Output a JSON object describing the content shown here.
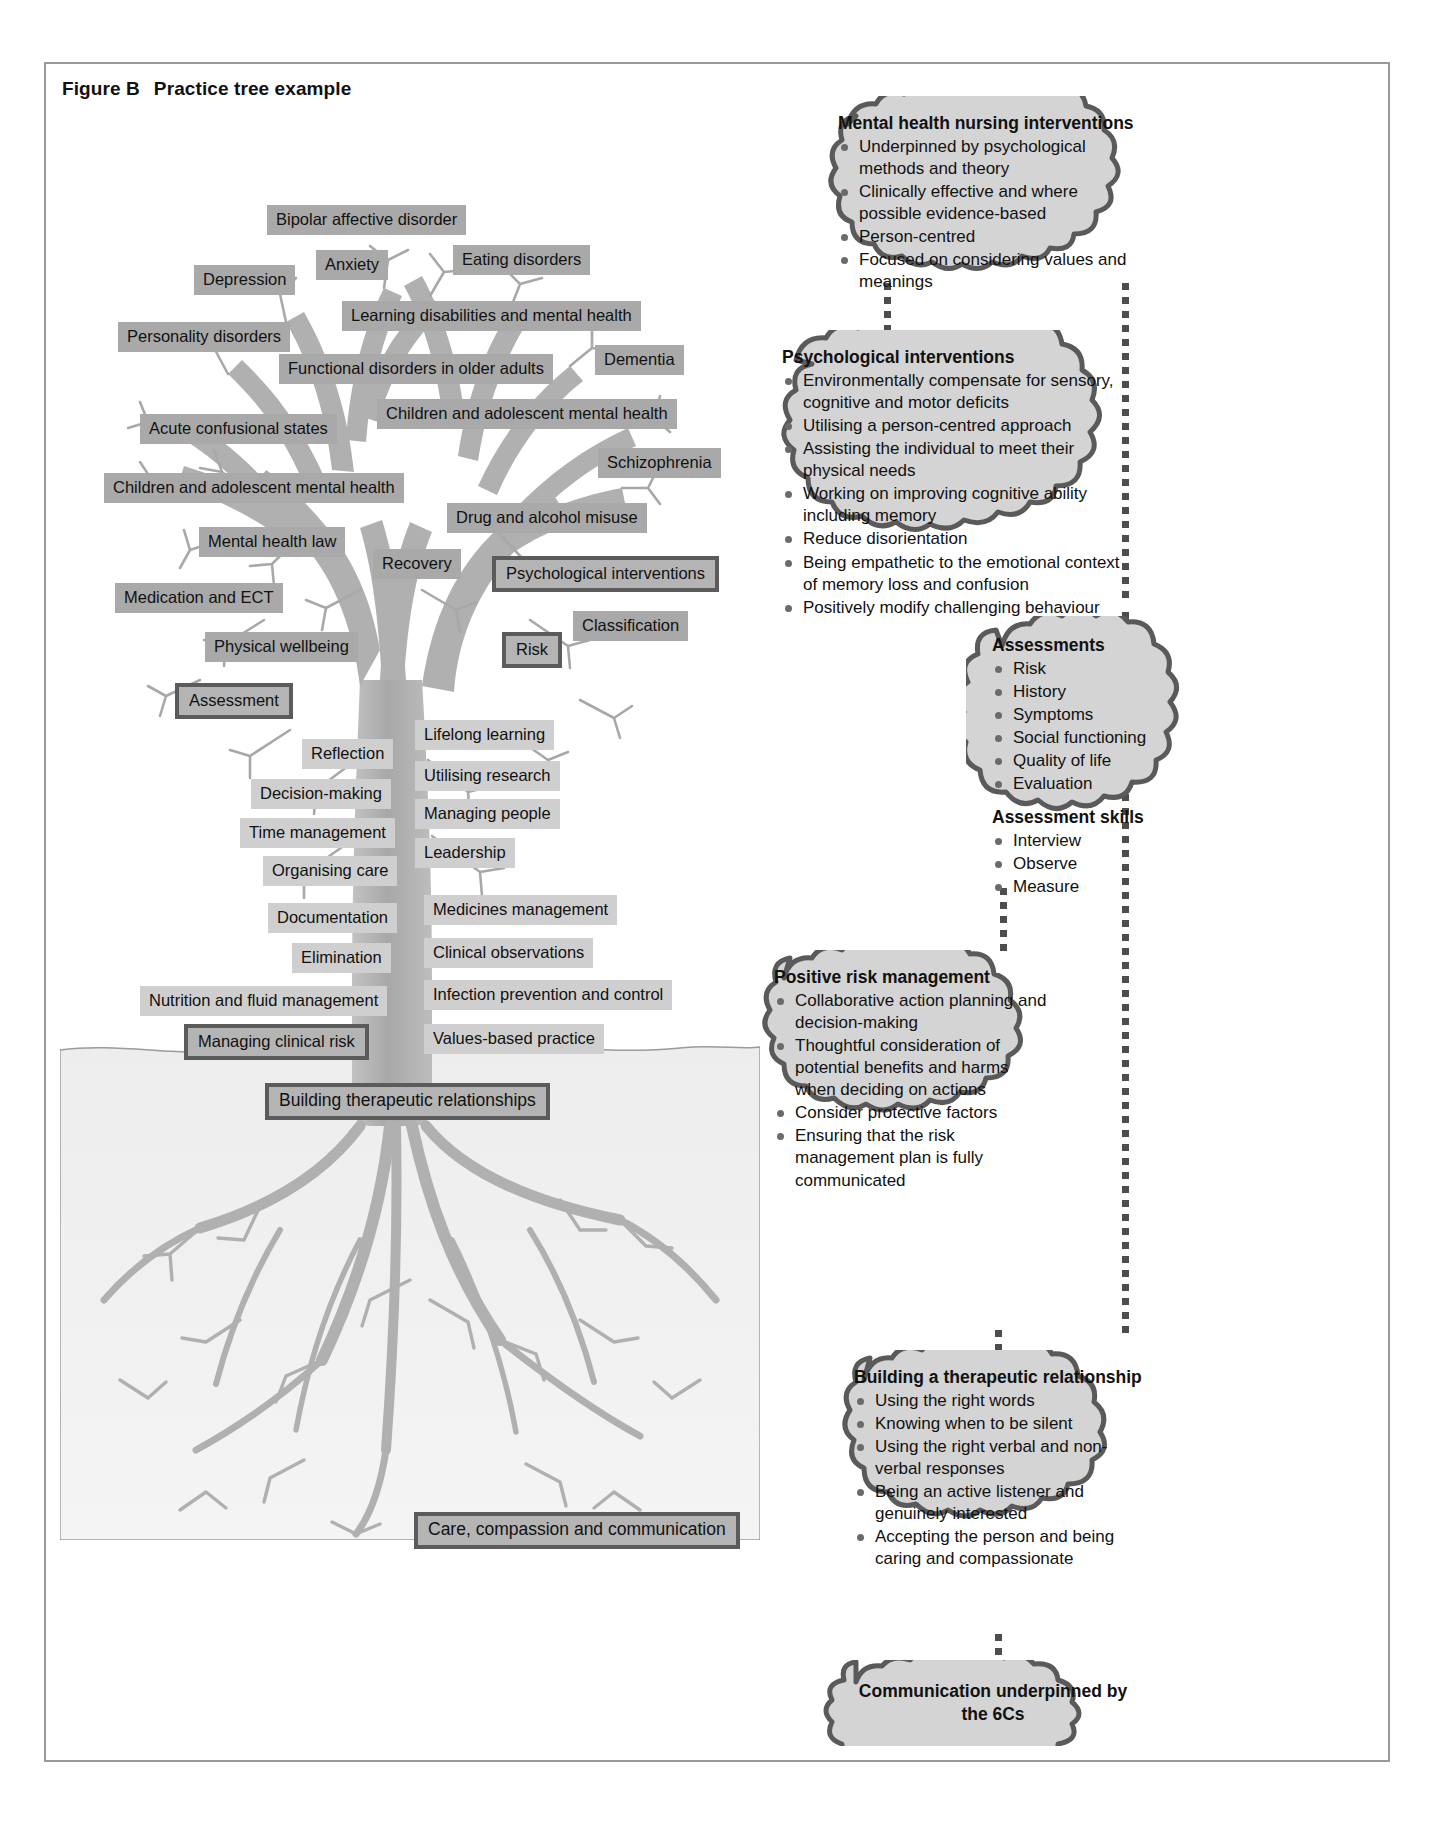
{
  "figure": {
    "label": "Figure B",
    "title": "Practice tree example"
  },
  "tree": {
    "branch_labels": [
      "Bipolar affective disorder",
      "Anxiety",
      "Eating disorders",
      "Depression",
      "Learning disabilities and mental health",
      "Personality disorders",
      "Functional disorders in older adults",
      "Dementia",
      "Acute confusional states",
      "Children and adolescent mental health",
      "Schizophrenia",
      "Children and adolescent mental health",
      "Drug and alcohol misuse",
      "Mental health law",
      "Recovery",
      "Psychological interventions",
      "Medication and ECT",
      "Classification",
      "Physical wellbeing",
      "Risk",
      "Assessment"
    ],
    "trunk_left_labels": [
      "Reflection",
      "Decision-making",
      "Time management",
      "Organising care",
      "Documentation",
      "Elimination",
      "Nutrition and fluid management",
      "Managing clinical risk"
    ],
    "trunk_right_labels": [
      "Lifelong learning",
      "Utilising research",
      "Managing people",
      "Leadership",
      "Medicines management",
      "Clinical observations",
      "Infection prevention and control",
      "Values-based practice"
    ],
    "root_labels": [
      "Building therapeutic relationships",
      "Care, compassion and communication"
    ],
    "highlighted_labels": [
      "Psychological interventions",
      "Risk",
      "Assessment",
      "Managing clinical risk",
      "Building therapeutic relationships",
      "Care, compassion and communication"
    ]
  },
  "clouds": [
    {
      "id": "mental-health-nursing-interventions",
      "title": "Mental health nursing interventions",
      "items": [
        "Underpinned by psychological methods and theory",
        "Clinically effective and where possible evidence-based",
        "Person-centred",
        "Focused on considering values and meanings"
      ]
    },
    {
      "id": "psychological-interventions",
      "title": "Psychological interventions",
      "items": [
        "Environmentally compensate for sensory, cognitive and motor deficits",
        "Utilising a person-centred approach",
        "Assisting the individual to meet their physical needs",
        "Working on improving cognitive ability including memory",
        "Reduce disorientation",
        "Being empathetic to the emotional context of memory loss and confusion",
        "Positively modify challenging behaviour"
      ]
    },
    {
      "id": "assessments",
      "title": "Assessments",
      "items": [
        "Risk",
        "History",
        "Symptoms",
        "Social functioning",
        "Quality of life",
        "Evaluation"
      ],
      "subtitle": "Assessment skills",
      "subitems": [
        "Interview",
        "Observe",
        "Measure"
      ]
    },
    {
      "id": "positive-risk-management",
      "title": "Positive risk management",
      "items": [
        "Collaborative action planning and decision-making",
        "Thoughtful consideration of potential benefits and harms when deciding on actions",
        "Consider protective factors",
        "Ensuring that the risk management plan is fully communicated"
      ]
    },
    {
      "id": "building-a-therapeutic-relationship",
      "title": "Building a therapeutic relationship",
      "items": [
        "Using the right words",
        "Knowing when to be silent",
        "Using the right verbal and non-verbal responses",
        "Being an active listener and genuinely interested",
        "Accepting the person and being caring and compassionate"
      ]
    },
    {
      "id": "communication-6cs",
      "title": "Communication underpinned by the 6Cs",
      "items": []
    }
  ],
  "colors": {
    "chip_dark": "#a9a9a9",
    "chip_light": "#cfcfcf",
    "highlight_border": "#5b5b5b",
    "cloud_fill": "#d4d4d4",
    "cloud_stroke": "#5a5a5a",
    "tree_fill": "#b0b0b0",
    "frame": "#9a9a9a"
  }
}
